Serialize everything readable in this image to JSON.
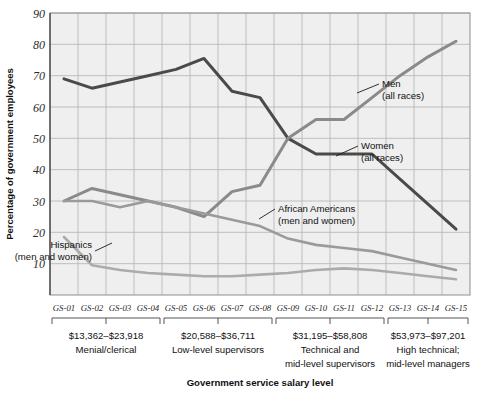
{
  "chart_data": {
    "type": "line",
    "title": "",
    "xlabel": "Government service salary level",
    "ylabel": "Percentage of government employees",
    "ylim": [
      0,
      90
    ],
    "yticks": [
      10,
      20,
      30,
      40,
      50,
      60,
      70,
      80,
      90
    ],
    "grid": true,
    "legend_position": "inline-annotations",
    "categories": [
      "GS-01",
      "GS-02",
      "GS-03",
      "GS-04",
      "GS-05",
      "GS-06",
      "GS-07",
      "GS-08",
      "GS-09",
      "GS-10",
      "GS-11",
      "GS-12",
      "GS-13",
      "GS-14",
      "GS-15"
    ],
    "series": [
      {
        "name": "Men (all races)",
        "color": "#4a4a4a",
        "values": [
          69,
          66,
          68,
          70,
          72,
          75.5,
          65,
          63,
          50,
          45,
          45,
          45,
          37,
          29,
          21
        ]
      },
      {
        "name": "Women (all races)",
        "color": "#8a8a8a",
        "values": [
          30,
          34,
          32,
          30,
          28,
          25,
          33,
          35,
          50,
          56,
          56,
          63,
          70,
          76,
          81
        ]
      },
      {
        "name": "African Americans (men and women)",
        "color": "#9a9a9a",
        "values": [
          30,
          30,
          28,
          30,
          28,
          26,
          24,
          22,
          18,
          16,
          15,
          14,
          12,
          10,
          8
        ]
      },
      {
        "name": "Hispanics (men and women)",
        "color": "#ababab",
        "values": [
          18.5,
          9.5,
          8,
          7,
          6.5,
          6,
          6,
          6.5,
          7,
          8,
          8.5,
          8,
          7,
          6,
          5
        ]
      }
    ],
    "annotations": [
      {
        "label_line1": "Men",
        "label_line2": "(all races)"
      },
      {
        "label_line1": "Women",
        "label_line2": "(all races)"
      },
      {
        "label_line1": "African Americans",
        "label_line2": "(men and women)"
      },
      {
        "label_line1": "Hispanics",
        "label_line2": "(men and women)"
      }
    ],
    "groups": [
      {
        "range": "$13,362–$23,918",
        "desc_line1": "Menial/clerical",
        "desc_line2": "",
        "from": "GS-01",
        "to": "GS-04"
      },
      {
        "range": "$20,588–$36,711",
        "desc_line1": "Low-level supervisors",
        "desc_line2": "",
        "from": "GS-05",
        "to": "GS-08"
      },
      {
        "range": "$31,195–$58,808",
        "desc_line1": "Technical and",
        "desc_line2": "mid-level supervisors",
        "from": "GS-09",
        "to": "GS-12"
      },
      {
        "range": "$53,973–$97,201",
        "desc_line1": "High technical;",
        "desc_line2": "mid-level managers",
        "from": "GS-13",
        "to": "GS-15"
      }
    ]
  },
  "colors": {
    "plot_background": "#efefef",
    "gridline": "#b9b9b9",
    "axis": "#4a4a4a",
    "text": "#1a1a1a"
  }
}
